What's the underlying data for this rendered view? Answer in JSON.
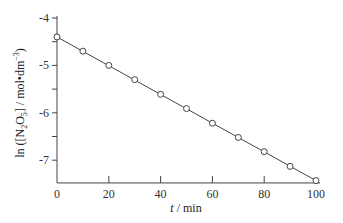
{
  "chart_data": {
    "type": "scatter",
    "title": "",
    "xlabel": "t / min",
    "ylabel": "ln ([N2O5] / mol·dm−3)",
    "xlim": [
      0,
      100
    ],
    "ylim": [
      -7.48,
      -4
    ],
    "grid": false,
    "legend": null,
    "x_ticks": [
      0,
      20,
      40,
      60,
      80,
      100
    ],
    "y_ticks": [
      -4,
      -5,
      -6,
      -7
    ],
    "series": [
      {
        "name": "ln[N2O5]",
        "marker": "open-circle",
        "line": "linear-fit",
        "x": [
          0,
          10,
          20,
          30,
          40,
          50,
          60,
          70,
          80,
          90,
          100
        ],
        "y": [
          -4.4,
          -4.7,
          -5.0,
          -5.3,
          -5.61,
          -5.91,
          -6.22,
          -6.52,
          -6.82,
          -7.13,
          -7.43
        ]
      }
    ]
  },
  "labels": {
    "x_ticks": [
      "0",
      "20",
      "40",
      "60",
      "80",
      "100"
    ],
    "y_ticks": [
      "-4",
      "-5",
      "-6",
      "-7"
    ],
    "xlabel_italic": "t",
    "xlabel_rest": " / min",
    "ylabel_ln": "ln ([N",
    "ylabel_sub2": "2",
    "ylabel_O": "O",
    "ylabel_sub5": "5",
    "ylabel_rest": "] / mol•dm",
    "ylabel_sup": "−3",
    "ylabel_close": ")"
  }
}
